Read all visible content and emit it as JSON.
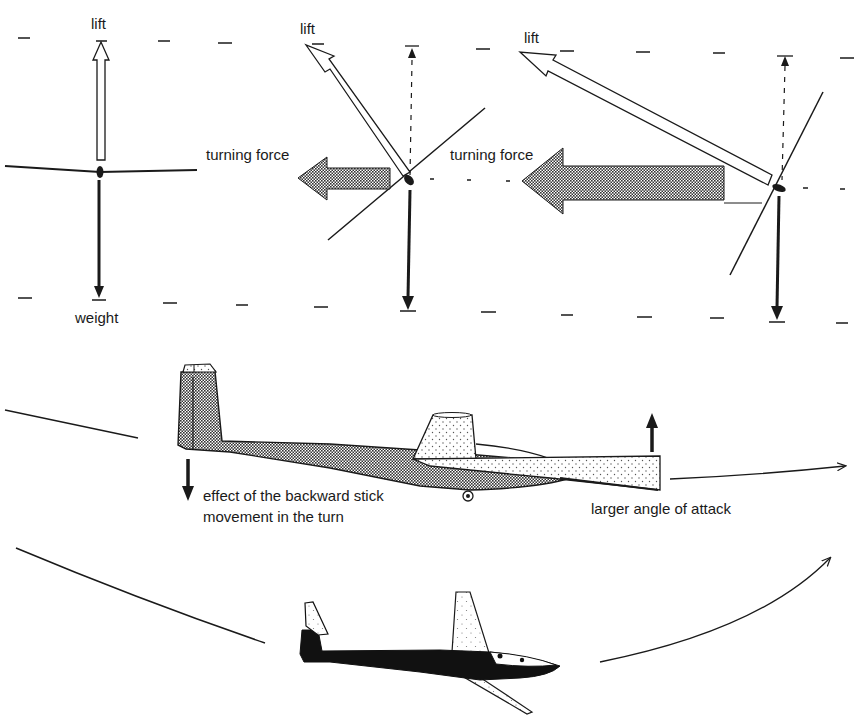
{
  "figure": {
    "panel_forces": {
      "level": {
        "lift_label": "lift",
        "weight_label": "weight"
      },
      "moderate_bank": {
        "lift_label": "lift",
        "turning_force_label": "turning force"
      },
      "steep_bank": {
        "lift_label": "lift",
        "turning_force_label": "turning force"
      }
    },
    "panel_side_view": {
      "tail_annotation_line1": "effect of the backward stick",
      "tail_annotation_line2": "movement in the turn",
      "wing_annotation": "larger angle of attack"
    },
    "colors": {
      "ink": "#1a1a1a",
      "paper": "#ffffff",
      "stipple": "#555555"
    }
  }
}
